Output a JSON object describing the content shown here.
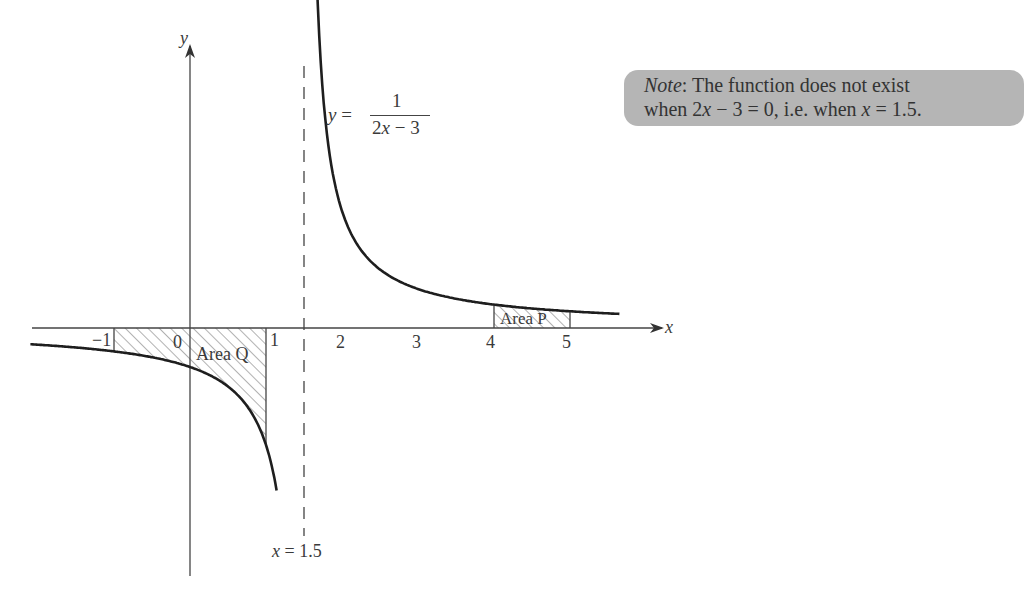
{
  "chart_data": {
    "type": "line",
    "title": "",
    "function": "y = 1/(2x - 3)",
    "xlabel": "x",
    "ylabel": "y",
    "x_tick_labels": [
      "-1",
      "0",
      "1",
      "2",
      "3",
      "4",
      "5"
    ],
    "x_ticks": [
      -1,
      0,
      1,
      2,
      3,
      4,
      5
    ],
    "xlim": [
      -2.1,
      6.4
    ],
    "ylim": [
      -2.0,
      2.5
    ],
    "grid": false,
    "asymptote": {
      "x": 1.5,
      "label": "x = 1.5",
      "style": "dashed"
    },
    "series": [
      {
        "name": "left branch",
        "domain": [
          -2.1,
          1.14
        ]
      },
      {
        "name": "right branch",
        "domain": [
          1.66,
          5.65
        ]
      }
    ],
    "shaded_regions": [
      {
        "name": "Area Q",
        "x_from": -1,
        "x_to": 1,
        "side": "below x-axis",
        "fill": "hatched"
      },
      {
        "name": "Area P",
        "x_from": 4,
        "x_to": 5,
        "side": "above x-axis",
        "fill": "hatched"
      }
    ],
    "annotations": [
      "y = 1/(2x − 3)",
      "x = 1.5",
      "Area Q",
      "Area P",
      "Note: The function does not exist when 2x − 3 = 0, i.e. when x = 1.5."
    ]
  },
  "labels": {
    "y_axis": "y",
    "x_axis": "x",
    "ticks": {
      "m1": "−1",
      "zero": "0",
      "one": "1",
      "two": "2",
      "three": "3",
      "four": "4",
      "five": "5"
    },
    "equation_lhs": "y =",
    "equation_num": "1",
    "equation_den": "2x − 3",
    "asymptote_label": "x = 1.5",
    "area_q": "Area Q",
    "area_p": "Area P"
  },
  "note": {
    "prefix": "Note",
    "line1_rest": ": The function does not exist",
    "line2_a": "when 2",
    "line2_x": "x",
    "line2_b": " − 3 = 0, i.e. when ",
    "line2_x2": "x",
    "line2_c": " = 1.5."
  },
  "colors": {
    "curve": "#1e1e1e",
    "axis": "#444444",
    "note_bg": "#b5b5b5",
    "hatch": "#555555"
  }
}
